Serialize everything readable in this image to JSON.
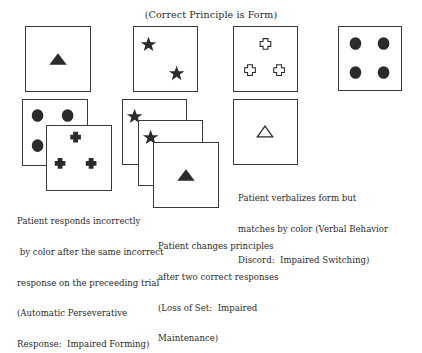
{
  "title": "(Correct Principle is Form)",
  "colors": {
    "shape_fill": "#2b2b2b",
    "border": "#3a3a3a",
    "background": "#ffffff"
  },
  "key_cards": [
    {
      "shape": "triangle",
      "count": 1,
      "fill": "solid"
    },
    {
      "shape": "star",
      "count": 2,
      "fill": "solid"
    },
    {
      "shape": "cross",
      "count": 3,
      "fill": "outline"
    },
    {
      "shape": "circle",
      "count": 4,
      "fill": "solid"
    }
  ],
  "examples": [
    {
      "id": "automatic-perseverative-response",
      "cards": [
        {
          "shape": "circle",
          "count": 4,
          "fill": "solid"
        },
        {
          "shape": "cross",
          "count": 3,
          "fill": "solid"
        }
      ],
      "caption_lines": [
        "Patient responds incorrectly",
        " by color after the same incorrect",
        "response on the preceeding trial",
        "(Automatic Perseverative",
        "Response:  Impaired Forming)"
      ]
    },
    {
      "id": "loss-of-set",
      "cards": [
        {
          "shape": "star",
          "count": 1,
          "fill": "solid"
        },
        {
          "shape": "star",
          "count": 1,
          "fill": "solid"
        },
        {
          "shape": "triangle",
          "count": 1,
          "fill": "solid"
        }
      ],
      "caption_lines": [
        "Patient changes principles",
        "after two correct responses",
        "(Loss of Set:  Impaired",
        "Maintenance)"
      ]
    },
    {
      "id": "verbal-behavior-discord",
      "cards": [
        {
          "shape": "triangle",
          "count": 1,
          "fill": "outline"
        }
      ],
      "caption_lines": [
        "Patient verbalizes form but",
        "matches by color (Verbal Behavior",
        "Discord:  Impaired Switching)"
      ]
    }
  ]
}
